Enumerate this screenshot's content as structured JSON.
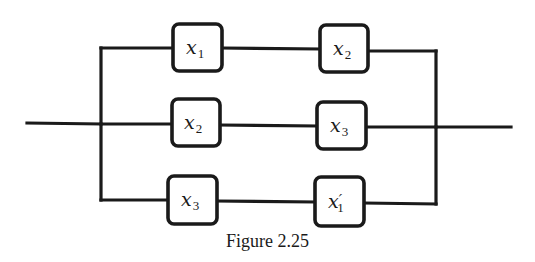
{
  "figure": {
    "caption": "Figure 2.25",
    "type": "series-parallel switching circuit",
    "branches": [
      {
        "name": "top",
        "switches": [
          {
            "var": "x",
            "sub": "1",
            "prime": ""
          },
          {
            "var": "x",
            "sub": "2",
            "prime": ""
          }
        ]
      },
      {
        "name": "middle",
        "switches": [
          {
            "var": "x",
            "sub": "2",
            "prime": ""
          },
          {
            "var": "x",
            "sub": "3",
            "prime": ""
          }
        ]
      },
      {
        "name": "bottom",
        "switches": [
          {
            "var": "x",
            "sub": "3",
            "prime": ""
          },
          {
            "var": "x",
            "sub": "1",
            "prime": "′"
          }
        ]
      }
    ]
  }
}
